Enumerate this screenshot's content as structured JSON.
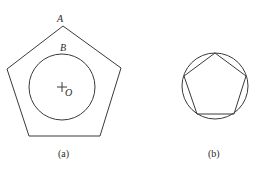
{
  "figure_a": {
    "caption": "(a)",
    "vertex_label_A": "A",
    "point_label_B": "B",
    "center_label_O": "O",
    "pentagon_points": "63,26 121,68 100,136 29,136 7,69",
    "circle": {
      "cx": 62,
      "cy": 87,
      "r": 33
    },
    "center_mark": {
      "x": 62,
      "y": 87
    }
  },
  "figure_b": {
    "caption": "(b)",
    "circle": {
      "cx": 215,
      "cy": 86,
      "r": 33
    },
    "pentagon_points": "215,53 246,76 234,114 197,114 184,76"
  },
  "colors": {
    "line": "#3a3a3a",
    "text": "#2a2a2a",
    "background": "#ffffff"
  }
}
